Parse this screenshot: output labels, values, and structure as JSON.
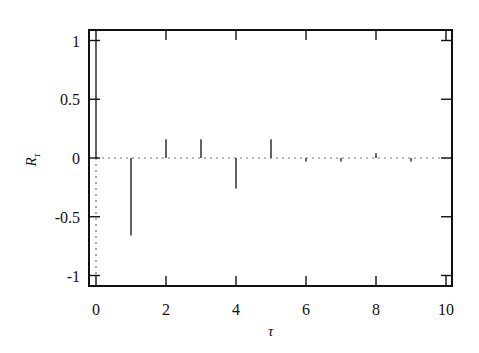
{
  "chart_data": {
    "type": "bar",
    "subtype": "stem/impulse",
    "title": "",
    "xlabel": "τ",
    "ylabel": "R_τ",
    "ylabel_main": "R",
    "ylabel_sub": "τ",
    "xlim": [
      0,
      10
    ],
    "ylim": [
      -1.1,
      1.1
    ],
    "xticks": [
      0,
      2,
      4,
      6,
      8,
      10
    ],
    "xtick_labels": [
      "0",
      "2",
      "4",
      "6",
      "8",
      "10"
    ],
    "yticks": [
      1,
      0.5,
      0,
      -0.5,
      -1
    ],
    "ytick_labels": [
      "1",
      "0.5",
      "0",
      "-0.5",
      "-1"
    ],
    "grid": false,
    "legend": null,
    "reference_line": {
      "style": "dotted",
      "y": 0,
      "vertical_at_x": 0,
      "from_y": -1
    },
    "x": [
      0,
      1,
      2,
      3,
      4,
      5,
      6,
      7,
      8,
      9,
      10
    ],
    "values": [
      1.0,
      -0.66,
      0.16,
      0.16,
      -0.26,
      0.16,
      -0.03,
      -0.03,
      0.04,
      -0.03,
      0.0
    ]
  },
  "colors": {
    "stem": "#222222",
    "frame": "#111111",
    "reference": "#777777"
  }
}
